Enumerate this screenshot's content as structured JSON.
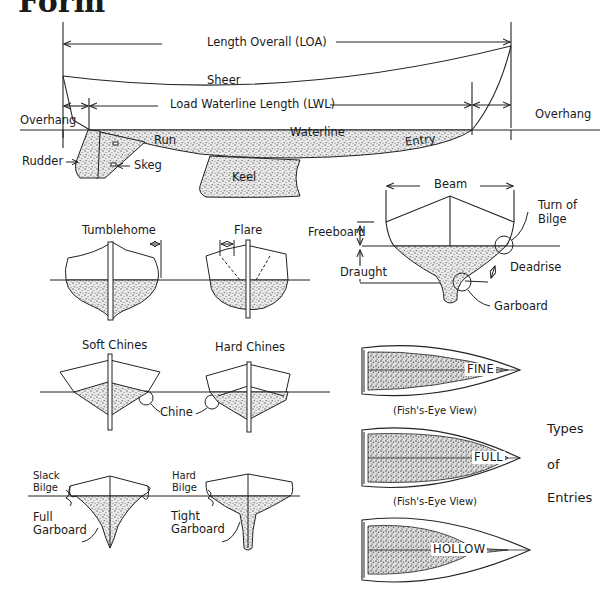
{
  "heading": "Form",
  "profile": {
    "loa": "Length Overall (LOA)",
    "sheer": "Sheer",
    "lwl": "Load Waterline Length (LWL)",
    "overhang_aft": "Overhang",
    "overhang_fwd": "Overhang",
    "waterline": "Waterline",
    "run": "Run",
    "entry": "Entry",
    "rudder": "Rudder",
    "skeg": "Skeg",
    "keel": "Keel"
  },
  "section": {
    "beam": "Beam",
    "freeboard": "Freeboard",
    "draught": "Draught",
    "turn_of_bilge_1": "Turn of",
    "turn_of_bilge_2": "Bilge",
    "deadrise": "Deadrise",
    "garboard": "Garboard"
  },
  "hull_shapes": {
    "tumblehome": "Tumblehome",
    "flare": "Flare",
    "soft_chines": "Soft Chines",
    "hard_chines": "Hard Chines",
    "chine": "Chine",
    "slack_bilge_1": "Slack",
    "slack_bilge_2": "Bilge",
    "hard_bilge_1": "Hard",
    "hard_bilge_2": "Bilge",
    "full_garboard_1": "Full",
    "full_garboard_2": "Garboard",
    "tight_garboard_1": "Tight",
    "tight_garboard_2": "Garboard"
  },
  "entries": {
    "fine": "FINE",
    "full": "FULL",
    "hollow": "HOLLOW",
    "fish_eye_1": "(Fish's-Eye View)",
    "fish_eye_2": "(Fish's-Eye View)",
    "title_1": "Types",
    "title_2": "of",
    "title_3": "Entries"
  }
}
